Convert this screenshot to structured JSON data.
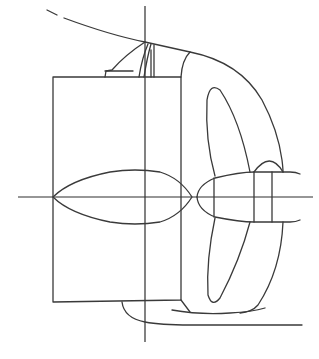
{
  "figure": {
    "stroke_color": "#3a3a3a",
    "background": "#ffffff",
    "components": [
      "center-vertical-axis",
      "center-horizontal-axis",
      "hull-stern-curve",
      "rudder-rectangle",
      "rudder-horn-strut",
      "rudder-bulb",
      "propeller-hub",
      "propeller-blade-upper",
      "propeller-blade-lower",
      "sole-piece"
    ]
  },
  "caption": {
    "text": "",
    "note": "caption cropped at image bottom"
  }
}
